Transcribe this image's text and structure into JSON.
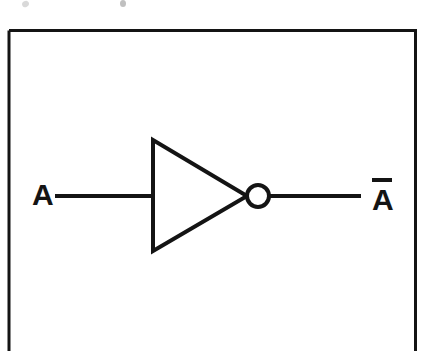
{
  "figure": {
    "name": "not-gate-inverter-diagram",
    "type": "logic-gate-schematic",
    "gate": "NOT",
    "alt_name": "Inverter",
    "background_color": "#ffffff",
    "line_color": "#141414"
  },
  "frame": {
    "name": "figure-border",
    "stroke_color": "#141414",
    "stroke_width": 3,
    "x": 9,
    "y": 29,
    "width": 407,
    "height": 330,
    "bottom_edge_cropped": true
  },
  "labels": {
    "input": "A",
    "output_letter": "A",
    "output_full": "Ā",
    "output_has_overbar": true
  },
  "wires": {
    "input": {
      "name": "input-wire",
      "x1": 55,
      "y1": 196,
      "x2": 153,
      "y2": 196
    },
    "output": {
      "name": "output-wire",
      "x1": 269,
      "y1": 196,
      "x2": 361,
      "y2": 196
    },
    "stroke_width": 4
  },
  "symbol": {
    "triangle": {
      "name": "inverter-triangle",
      "points": "153,140 153,251 247,196",
      "fill": "none",
      "stroke_width": 4
    },
    "bubble": {
      "name": "inversion-bubble",
      "cx": 258,
      "cy": 196,
      "r": 11,
      "fill": "#ffffff",
      "stroke_width": 4
    }
  },
  "artifacts": {
    "note": "faint scan marks from cropped text above the frame"
  }
}
